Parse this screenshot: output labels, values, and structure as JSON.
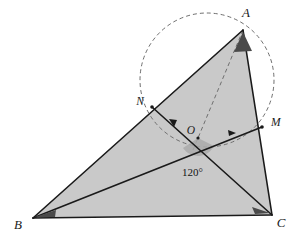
{
  "figure": {
    "canvas": {
      "width": 307,
      "height": 242,
      "background": "#ffffff"
    },
    "style": {
      "triangle_fill": "#c9c9c9",
      "stroke_color": "#1a1a1a",
      "dash_color": "#6f6f6f",
      "angle_marker_fill": "#4a4a4a",
      "angle_arc_fill": "#aaaaaa"
    },
    "labels": {
      "vertex_a": "A",
      "vertex_b": "B",
      "vertex_c": "C",
      "point_o": "O",
      "point_m": "M",
      "point_n": "N",
      "angle_at_o": "120°"
    },
    "points": {
      "A": {
        "x": 243,
        "y": 30
      },
      "B": {
        "x": 33,
        "y": 218
      },
      "C": {
        "x": 272,
        "y": 215
      },
      "O": {
        "x": 198,
        "y": 138
      },
      "M": {
        "x": 262,
        "y": 127
      },
      "N": {
        "x": 152,
        "y": 107
      }
    },
    "label_positions": {
      "A": {
        "x": 246,
        "y": 17
      },
      "B": {
        "x": 18,
        "y": 229
      },
      "C": {
        "x": 281,
        "y": 227
      },
      "O": {
        "x": 191,
        "y": 134
      },
      "M": {
        "x": 271,
        "y": 126
      },
      "N": {
        "x": 140,
        "y": 105
      },
      "angle": {
        "x": 182,
        "y": 176
      }
    },
    "circle": {
      "cx": 207,
      "cy": 80,
      "r": 67,
      "dashed": true
    },
    "segments": [
      {
        "name": "side-ab",
        "from": "A",
        "to": "B",
        "style": "solid"
      },
      {
        "name": "side-bc",
        "from": "B",
        "to": "C",
        "style": "solid"
      },
      {
        "name": "side-ca",
        "from": "C",
        "to": "A",
        "style": "solid"
      },
      {
        "name": "cevian-bm",
        "from": "B",
        "to": "M",
        "style": "solid"
      },
      {
        "name": "cevian-nc",
        "from": "N",
        "to": "C",
        "style": "solid"
      },
      {
        "name": "cevian-ao",
        "from": "A",
        "to": "O",
        "style": "dashed"
      }
    ],
    "tick_arrows": [
      {
        "name": "arrow-on-no",
        "x": 174,
        "y": 122,
        "angle": 41
      },
      {
        "name": "arrow-on-om",
        "x": 232,
        "y": 133,
        "angle": -10
      }
    ]
  }
}
